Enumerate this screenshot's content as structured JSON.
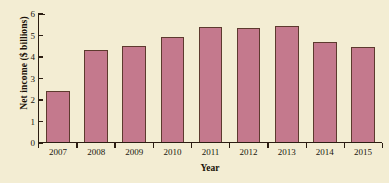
{
  "chart_data": {
    "type": "bar",
    "title": "",
    "subtitle": "",
    "xlabel": "Year",
    "ylabel": "Net income ($ billions)",
    "categories": [
      "2007",
      "2008",
      "2009",
      "2010",
      "2011",
      "2012",
      "2013",
      "2014",
      "2015"
    ],
    "values": [
      2.4,
      4.3,
      4.5,
      4.9,
      5.4,
      5.35,
      5.45,
      4.7,
      4.45
    ],
    "series": [
      {
        "name": "Net income",
        "values": [
          2.4,
          4.3,
          4.5,
          4.9,
          5.4,
          5.35,
          5.45,
          4.7,
          4.45
        ]
      }
    ],
    "ylim": [
      0,
      6
    ],
    "yticks": [
      0,
      1,
      2,
      3,
      4,
      5,
      6
    ],
    "ytick_labels": [
      "0",
      "1",
      "2",
      "3",
      "4",
      "5",
      "6"
    ],
    "grid": false,
    "legend": false,
    "bar_color": "#c4798d",
    "bar_edge_color": "#5d3a2e",
    "background_color": "#f3edd3",
    "axis_color": "#2b1d12"
  }
}
